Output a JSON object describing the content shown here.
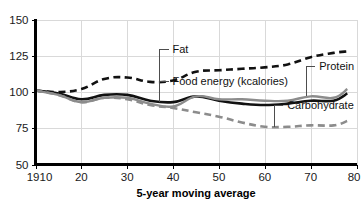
{
  "chart_data": {
    "type": "line",
    "title": "",
    "subtitle": "",
    "xlabel": "5-year moving average",
    "ylabel": "",
    "xlim": [
      1910,
      1980
    ],
    "ylim": [
      50,
      150
    ],
    "grid": true,
    "legend_position": "inline-annotations",
    "x_tick_labels": [
      "1910",
      "20",
      "30",
      "40",
      "50",
      "60",
      "70",
      "80"
    ],
    "x_tick_values": [
      1910,
      1920,
      1930,
      1940,
      1950,
      1960,
      1970,
      1980
    ],
    "y_tick_labels": [
      "50",
      "75",
      "100",
      "125",
      "150"
    ],
    "y_tick_values": [
      50,
      75,
      100,
      125,
      150
    ],
    "x": [
      1910,
      1915,
      1920,
      1925,
      1930,
      1935,
      1940,
      1945,
      1950,
      1955,
      1960,
      1965,
      1970,
      1975,
      1978
    ],
    "series": [
      {
        "name": "Fat",
        "label": "Fat",
        "style": "dashed",
        "color": "#111111",
        "values": [
          101,
          100,
          102,
          109,
          110,
          107,
          108,
          114,
          115,
          116,
          117,
          119,
          124,
          127,
          128
        ]
      },
      {
        "name": "Food energy (kcalories)",
        "label": "Food energy (kcalories)",
        "style": "solid",
        "color": "#111111",
        "values": [
          101,
          99,
          95,
          98,
          98,
          94,
          93,
          97,
          94,
          92,
          91,
          92,
          94,
          94,
          99
        ]
      },
      {
        "name": "Protein",
        "label": "Protein",
        "style": "solid",
        "color": "#8c8c8c",
        "values": [
          101,
          98,
          93,
          96,
          96,
          92,
          90,
          97,
          95,
          95,
          94,
          94,
          97,
          96,
          102
        ]
      },
      {
        "name": "Carbohydrate",
        "label": "Carbohydrate",
        "style": "dashed",
        "color": "#8c8c8c",
        "values": [
          101,
          98,
          93,
          96,
          95,
          91,
          89,
          86,
          83,
          79,
          76,
          76,
          77,
          77,
          80
        ]
      }
    ],
    "annotations": [
      {
        "text": "Fat",
        "target_x": 1937,
        "target_y": 107,
        "label_x": 1939,
        "label_y": 127
      },
      {
        "text": "Food energy (kcalories)",
        "target_x": 1937,
        "target_y": 93,
        "label_x": 1939,
        "label_y": 105
      },
      {
        "text": "Protein",
        "target_x": 1969,
        "target_y": 97,
        "label_x": 1971,
        "label_y": 115
      },
      {
        "text": "Carbohydrate",
        "target_x": 1962,
        "target_y": 76,
        "label_x": 1964,
        "label_y": 88
      }
    ]
  },
  "caption": {
    "text": "5-year moving average"
  }
}
